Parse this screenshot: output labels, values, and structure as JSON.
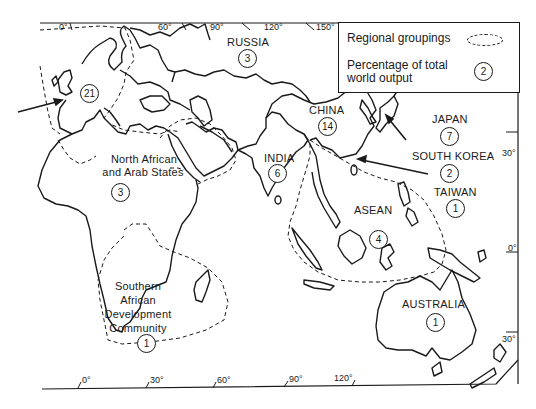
{
  "legend": {
    "regional_groupings_label": "Regional groupings",
    "percentage_label": "Percentage of total world output",
    "sample_value": "2"
  },
  "regions": [
    {
      "name": "",
      "value": "21",
      "note": "Europe (arrow)"
    },
    {
      "name": "RUSSIA",
      "value": "3"
    },
    {
      "name": "CHINA",
      "value": "14"
    },
    {
      "name": "JAPAN",
      "value": "7"
    },
    {
      "name": "SOUTH KOREA",
      "value": "2"
    },
    {
      "name": "TAIWAN",
      "value": "1"
    },
    {
      "name": "INDIA",
      "value": "6"
    },
    {
      "name": "ASEAN",
      "value": "4"
    },
    {
      "name": "North African and Arab States",
      "line1": "North African",
      "line2": "and Arab States",
      "value": "3"
    },
    {
      "name": "Southern African Development Community",
      "line1": "Southern",
      "line2": "African",
      "line3": "Development",
      "line4": "Community",
      "value": "1"
    },
    {
      "name": "AUSTRALIA",
      "value": "1"
    }
  ],
  "top_ticks": [
    "0°",
    "60°",
    "90°",
    "120°",
    "150°"
  ],
  "bottom_ticks": [
    "0°",
    "30°",
    "60°",
    "90°",
    "120°"
  ],
  "right_ticks": [
    "30°",
    "0°",
    "30°"
  ]
}
